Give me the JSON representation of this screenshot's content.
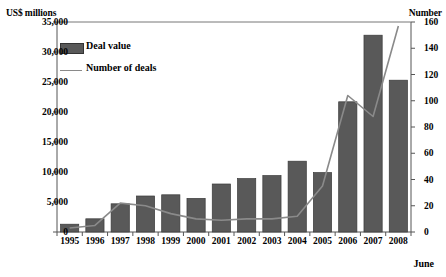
{
  "chart_data": {
    "type": "bar",
    "title": "",
    "subtitle": "",
    "categories": [
      "1995",
      "1996",
      "1997",
      "1998",
      "1999",
      "2000",
      "2001",
      "2002",
      "2003",
      "2004",
      "2005",
      "2006",
      "2007",
      "2008"
    ],
    "series": [
      {
        "name": "Deal value",
        "kind": "bar",
        "axis": "left",
        "unit": "US$ millions",
        "color": "#595959",
        "values": [
          1300,
          2200,
          4700,
          6000,
          6200,
          5600,
          8000,
          8900,
          9400,
          11800,
          9900,
          21700,
          32800,
          25300
        ]
      },
      {
        "name": "Number of deals",
        "kind": "line",
        "axis": "right",
        "unit": "Number",
        "color": "#8a8a8a",
        "values": [
          3,
          5,
          22,
          20,
          14,
          10,
          9,
          10,
          10,
          12,
          35,
          104,
          88,
          157
        ]
      }
    ],
    "left_axis": {
      "label": "US$ millions",
      "min": 0,
      "max": 35000,
      "step": 5000,
      "ticks": [
        "0",
        "5,000",
        "10,000",
        "15,000",
        "20,000",
        "25,000",
        "30,000",
        "35,000"
      ],
      "tick_values": [
        0,
        5000,
        10000,
        15000,
        20000,
        25000,
        30000,
        35000
      ]
    },
    "right_axis": {
      "label": "Number",
      "min": 0,
      "max": 160,
      "step": 20,
      "ticks": [
        "0",
        "20",
        "40",
        "60",
        "80",
        "100",
        "120",
        "140",
        "160"
      ],
      "tick_values": [
        0,
        20,
        40,
        60,
        80,
        100,
        120,
        140,
        160
      ]
    },
    "xlabel": "",
    "ylabel": "US$ millions",
    "grid": false,
    "legend": {
      "position": "top-left-inside",
      "entries": [
        "Deal value",
        "Number of deals"
      ]
    },
    "annotations": [
      "June"
    ]
  },
  "labels": {
    "left_axis_title": "US$ millions",
    "right_axis_title": "Number",
    "period_note": "June",
    "legend_bar": "Deal value",
    "legend_line": "Number of deals"
  }
}
